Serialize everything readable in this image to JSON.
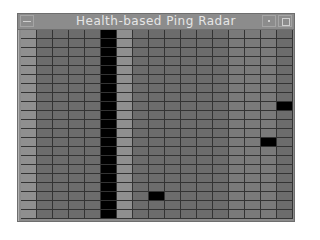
{
  "window": {
    "title": "Health-based Ping Radar",
    "buttons": {
      "menu": "window-menu",
      "minimize": "minimize",
      "maximize": "maximize"
    }
  },
  "grid": {
    "rows": 21,
    "cols": 17,
    "colors": {
      "light": "#8f8f8f",
      "normal": "#6c6c6c",
      "mid": "#7a7a7a",
      "dead": "#000000"
    },
    "column_shades": [
      "light",
      "normal",
      "normal",
      "normal",
      "normal",
      "dead",
      "light",
      "normal",
      "normal",
      "normal",
      "normal",
      "normal",
      "normal",
      "mid",
      "mid",
      "mid",
      "normal"
    ],
    "dead_cells": [
      [
        8,
        16
      ],
      [
        12,
        15
      ],
      [
        18,
        8
      ]
    ]
  }
}
